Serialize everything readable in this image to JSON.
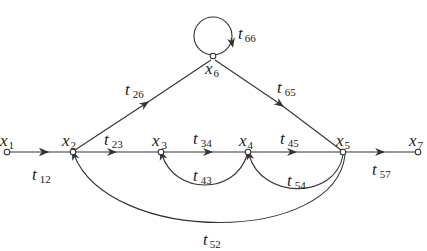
{
  "diagram": {
    "type": "signal-flow-graph",
    "colors": {
      "stroke": "#333333",
      "background": "#ffffff",
      "text": "#222222"
    },
    "nodes": [
      {
        "id": "x1",
        "base": "x",
        "sub": "1",
        "x": 7,
        "y": 152
      },
      {
        "id": "x2",
        "base": "x",
        "sub": "2",
        "x": 73,
        "y": 152
      },
      {
        "id": "x3",
        "base": "x",
        "sub": "3",
        "x": 161,
        "y": 152
      },
      {
        "id": "x4",
        "base": "x",
        "sub": "4",
        "x": 248,
        "y": 152
      },
      {
        "id": "x5",
        "base": "x",
        "sub": "5",
        "x": 343,
        "y": 152
      },
      {
        "id": "x6",
        "base": "x",
        "sub": "6",
        "x": 213,
        "y": 58
      },
      {
        "id": "x7",
        "base": "x",
        "sub": "7",
        "x": 418,
        "y": 152
      }
    ],
    "branches": [
      {
        "id": "t12",
        "base": "t",
        "sub": "12",
        "from": "x1",
        "to": "x2"
      },
      {
        "id": "t23",
        "base": "t",
        "sub": "23",
        "from": "x2",
        "to": "x3"
      },
      {
        "id": "t34",
        "base": "t",
        "sub": "34",
        "from": "x3",
        "to": "x4"
      },
      {
        "id": "t45",
        "base": "t",
        "sub": "45",
        "from": "x4",
        "to": "x5"
      },
      {
        "id": "t57",
        "base": "t",
        "sub": "57",
        "from": "x5",
        "to": "x7"
      },
      {
        "id": "t26",
        "base": "t",
        "sub": "26",
        "from": "x2",
        "to": "x6"
      },
      {
        "id": "t65",
        "base": "t",
        "sub": "65",
        "from": "x6",
        "to": "x5"
      },
      {
        "id": "t66",
        "base": "t",
        "sub": "66",
        "from": "x6",
        "to": "x6"
      },
      {
        "id": "t43",
        "base": "t",
        "sub": "43",
        "from": "x4",
        "to": "x3"
      },
      {
        "id": "t54",
        "base": "t",
        "sub": "54",
        "from": "x5",
        "to": "x4"
      },
      {
        "id": "t52",
        "base": "t",
        "sub": "52",
        "from": "x5",
        "to": "x2"
      }
    ]
  }
}
